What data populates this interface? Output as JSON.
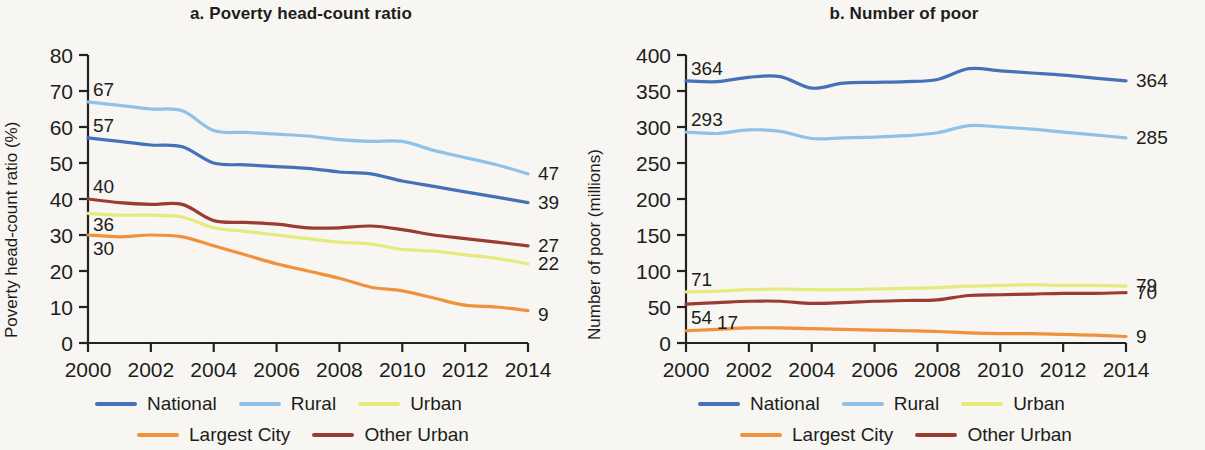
{
  "figure": {
    "background": "#f7f6f2",
    "panels": [
      "a",
      "b"
    ]
  },
  "colors": {
    "national": "#4472b8",
    "rural": "#8fc2e8",
    "urban": "#e5ea7c",
    "largest_city": "#f0923c",
    "other_urban": "#9b3b33",
    "axis": "#222222",
    "text": "#1d1d1b"
  },
  "legend": {
    "row1": [
      "National",
      "Rural",
      "Urban"
    ],
    "row2": [
      "Largest City",
      "Other Urban"
    ]
  },
  "panel_a": {
    "title": "a. Poverty head-count ratio",
    "ylabel": "Poverty head-count ratio (%)"
  },
  "panel_b": {
    "title": "b. Number of poor",
    "ylabel": "Number of poor (millions)"
  },
  "chart_data": [
    {
      "type": "line",
      "panel": "a",
      "title": "a. Poverty head-count ratio",
      "xlabel": "",
      "ylabel": "Poverty head-count ratio (%)",
      "xlim": [
        2000,
        2014
      ],
      "ylim": [
        0,
        80
      ],
      "yticks": [
        0,
        10,
        20,
        30,
        40,
        50,
        60,
        70,
        80
      ],
      "xticks": [
        2000,
        2002,
        2004,
        2006,
        2008,
        2010,
        2012,
        2014
      ],
      "grid": false,
      "legend_position": "bottom",
      "x": [
        2000,
        2001,
        2002,
        2003,
        2004,
        2005,
        2006,
        2007,
        2008,
        2009,
        2010,
        2011,
        2012,
        2013,
        2014
      ],
      "series": [
        {
          "name": "National",
          "color": "#4472b8",
          "values": [
            57,
            56,
            55,
            54.5,
            50,
            49.5,
            49,
            48.5,
            47.5,
            47,
            45,
            43.5,
            42,
            40.5,
            39
          ],
          "start_label": "57",
          "end_label": "39"
        },
        {
          "name": "Rural",
          "color": "#8fc2e8",
          "values": [
            67,
            66,
            65,
            64.5,
            59,
            58.5,
            58,
            57.5,
            56.5,
            56,
            56,
            53.5,
            51.5,
            49.5,
            47
          ],
          "start_label": "67",
          "end_label": "47"
        },
        {
          "name": "Urban",
          "color": "#e5ea7c",
          "values": [
            36,
            35.5,
            35.5,
            35,
            32,
            31,
            30,
            29,
            28,
            27.5,
            26,
            25.5,
            24.5,
            23.5,
            22
          ],
          "start_label": "36",
          "end_label": "22"
        },
        {
          "name": "Largest City",
          "color": "#f0923c",
          "values": [
            30,
            29.5,
            30,
            29.5,
            27,
            24.5,
            22,
            20,
            18,
            15.5,
            14.5,
            12.5,
            10.5,
            10,
            9
          ],
          "start_label": "30",
          "end_label": "9"
        },
        {
          "name": "Other Urban",
          "color": "#9b3b33",
          "values": [
            40,
            39,
            38.5,
            38.5,
            34,
            33.5,
            33,
            32,
            32,
            32.5,
            31.5,
            30,
            29,
            28,
            27
          ],
          "start_label": "40",
          "end_label": "27"
        }
      ]
    },
    {
      "type": "line",
      "panel": "b",
      "title": "b. Number of poor",
      "xlabel": "",
      "ylabel": "Number of poor (millions)",
      "xlim": [
        2000,
        2014
      ],
      "ylim": [
        0,
        400
      ],
      "yticks": [
        0,
        50,
        100,
        150,
        200,
        250,
        300,
        350,
        400
      ],
      "xticks": [
        2000,
        2002,
        2004,
        2006,
        2008,
        2010,
        2012,
        2014
      ],
      "grid": false,
      "legend_position": "bottom",
      "x": [
        2000,
        2001,
        2002,
        2003,
        2004,
        2005,
        2006,
        2007,
        2008,
        2009,
        2010,
        2011,
        2012,
        2013,
        2014
      ],
      "series": [
        {
          "name": "National",
          "color": "#4472b8",
          "values": [
            364,
            363,
            369,
            370,
            354,
            361,
            362,
            363,
            366,
            381,
            378,
            375,
            372,
            368,
            364
          ],
          "start_label": "364",
          "end_label": "364"
        },
        {
          "name": "Rural",
          "color": "#8fc2e8",
          "values": [
            293,
            291,
            296,
            294,
            284,
            285,
            286,
            288,
            292,
            302,
            300,
            297,
            293,
            289,
            285
          ],
          "start_label": "293",
          "end_label": "285"
        },
        {
          "name": "Urban",
          "color": "#e5ea7c",
          "values": [
            71,
            72,
            74,
            75,
            74,
            74,
            75,
            76,
            77,
            79,
            80,
            81,
            80,
            80,
            79
          ],
          "start_label": "71",
          "end_label": "79"
        },
        {
          "name": "Other Urban",
          "color": "#9b3b33",
          "values": [
            54,
            56,
            58,
            58,
            55,
            56,
            58,
            59,
            60,
            66,
            67,
            68,
            69,
            69,
            70
          ],
          "start_label": "54",
          "end_label": "70"
        },
        {
          "name": "Largest City",
          "color": "#f0923c",
          "values": [
            17,
            19,
            21,
            21,
            20,
            19,
            18,
            17,
            16,
            14,
            13,
            13,
            12,
            11,
            9
          ],
          "start_label": "17",
          "end_label": "9"
        }
      ]
    }
  ]
}
